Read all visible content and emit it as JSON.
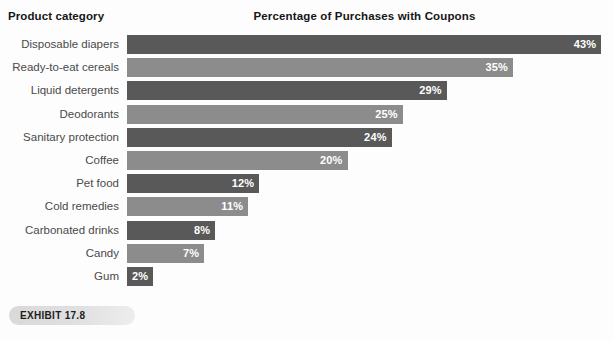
{
  "header": {
    "category_axis_title": "Product category",
    "chart_title": "Percentage of Purchases with Coupons"
  },
  "exhibit": {
    "label": "EXHIBIT 17.8"
  },
  "colors": {
    "bar_dark": "#595959",
    "bar_light": "#8c8c8c",
    "value_text": "#ffffff",
    "category_text": "#4a4a4a",
    "title_text": "#161616",
    "background": "#fdfdfd",
    "exhibit_pill": "#dcdcdc"
  },
  "chart_data": {
    "type": "bar",
    "orientation": "horizontal",
    "title": "Percentage of Purchases with Coupons",
    "xlabel": "",
    "ylabel": "Product category",
    "xlim": [
      0,
      44
    ],
    "grid": false,
    "legend": null,
    "value_suffix": "%",
    "categories": [
      "Disposable diapers",
      "Ready-to-eat cereals",
      "Liquid detergents",
      "Deodorants",
      "Sanitary protection",
      "Coffee",
      "Pet food",
      "Cold remedies",
      "Carbonated drinks",
      "Candy",
      "Gum"
    ],
    "values": [
      43,
      35,
      29,
      25,
      24,
      20,
      12,
      11,
      8,
      7,
      2
    ],
    "labels": [
      "43%",
      "35%",
      "29%",
      "25%",
      "24%",
      "20%",
      "12%",
      "11%",
      "8%",
      "7%",
      "2%"
    ],
    "bar_colors": [
      "#595959",
      "#8c8c8c",
      "#595959",
      "#8c8c8c",
      "#595959",
      "#8c8c8c",
      "#595959",
      "#8c8c8c",
      "#595959",
      "#8c8c8c",
      "#595959"
    ]
  },
  "render": {
    "bar_origin_x": 127,
    "px_per_unit": 11.03,
    "row_pitch": 23.2,
    "min_bar_px": 26
  }
}
